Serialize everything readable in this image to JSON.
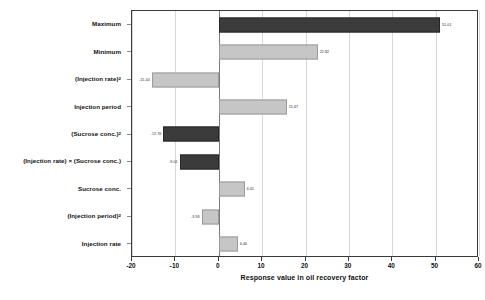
{
  "chart_data": {
    "type": "bar",
    "orientation": "horizontal",
    "title": "",
    "xlabel": "Response value in oil recovery factor",
    "ylabel": "",
    "xlim": [
      -20,
      60
    ],
    "xticks": [
      -20,
      -10,
      0,
      10,
      20,
      30,
      40,
      50,
      60
    ],
    "xtick_labels": [
      "-20",
      "-10",
      "0",
      "10",
      "20",
      "30",
      "40",
      "50",
      "60"
    ],
    "grid": true,
    "legend": "none",
    "categories": [
      "Maximum",
      "Minimum",
      "(Injection rate)²",
      "Injection period",
      "(Sucrose conc.)²",
      "(Injection rate) × (Sucrose conc.)",
      "Sucrose conc.",
      "(Injection period)²",
      "Injection rate"
    ],
    "values": [
      51.01,
      22.82,
      -15.44,
      15.67,
      -12.76,
      -9.01,
      6.01,
      -3.93,
      4.4
    ],
    "value_labels": [
      "51.01",
      "22.82",
      "-15.44",
      "15.67",
      "-12.76",
      "-9.01",
      "6.01",
      "-3.93",
      "4.40"
    ],
    "bar_styles": [
      "dark",
      "light",
      "light",
      "light",
      "dark",
      "dark",
      "light",
      "light",
      "light"
    ],
    "colors": {
      "dark_bar": "#3b3b3b",
      "light_bar": "#c6c6c6",
      "axis": "#3a3a3a",
      "gridline": "#d8d8d8",
      "zero_line": "#7a7a7a",
      "text": "#111111",
      "background": "#ffffff"
    }
  }
}
